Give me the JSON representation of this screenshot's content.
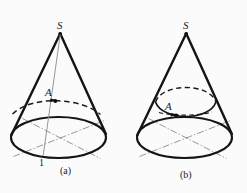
{
  "figure": {
    "background_color": "#fbfbfc",
    "ink_color": "#1a1a1a",
    "thin_ink_color": "#6e6e73",
    "panels": [
      {
        "id": "panel-a",
        "caption": "(a)",
        "apex_label": "S",
        "point_label": "A",
        "base_label": "1",
        "description": "cone with slant line from apex through point A to base point 1, dashed hidden ellipse arc through A"
      },
      {
        "id": "panel-b",
        "caption": "(b)",
        "apex_label": "S",
        "point_label": "A",
        "description": "cone with horizontal circular cross-section ellipse containing point A and a directional arrow"
      }
    ]
  }
}
